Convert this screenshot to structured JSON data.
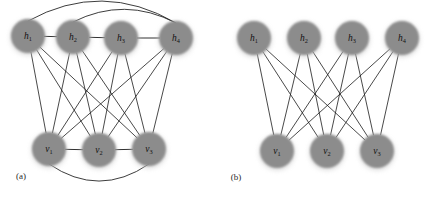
{
  "figure": {
    "background_color": "#ffffff",
    "node_fill_color": "#8c8c8c",
    "edge_color": "#1a1a1a",
    "label_color": "#111111",
    "node_radius": 17,
    "panels": [
      {
        "id": "a",
        "caption": "(a)",
        "caption_x": 21,
        "caption_y": 177,
        "hidden_layer": {
          "name": "hidden-units",
          "nodes": [
            {
              "id": "h1",
              "label": "h",
              "subscript": "1",
              "cx": 28,
              "cy": 36
            },
            {
              "id": "h2",
              "label": "h",
              "subscript": "2",
              "cx": 73,
              "cy": 37
            },
            {
              "id": "h3",
              "label": "h",
              "subscript": "3",
              "cx": 121,
              "cy": 38
            },
            {
              "id": "h4",
              "label": "h",
              "subscript": "4",
              "cx": 176,
              "cy": 38
            }
          ]
        },
        "visible_layer": {
          "name": "visible-units",
          "nodes": [
            {
              "id": "v1",
              "label": "v",
              "subscript": "1",
              "cx": 49,
              "cy": 149
            },
            {
              "id": "v2",
              "label": "v",
              "subscript": "2",
              "cx": 99,
              "cy": 150
            },
            {
              "id": "v3",
              "label": "v",
              "subscript": "3",
              "cx": 149,
              "cy": 149
            }
          ]
        },
        "bipartite_edges": [
          [
            "h1",
            "v1"
          ],
          [
            "h1",
            "v2"
          ],
          [
            "h1",
            "v3"
          ],
          [
            "h2",
            "v1"
          ],
          [
            "h2",
            "v2"
          ],
          [
            "h2",
            "v3"
          ],
          [
            "h3",
            "v1"
          ],
          [
            "h3",
            "v2"
          ],
          [
            "h3",
            "v3"
          ],
          [
            "h4",
            "v1"
          ],
          [
            "h4",
            "v2"
          ],
          [
            "h4",
            "v3"
          ]
        ],
        "lateral_edges": [
          [
            "h1",
            "h2"
          ],
          [
            "h2",
            "h3"
          ],
          [
            "h3",
            "h4"
          ],
          [
            "v1",
            "v2"
          ],
          [
            "v2",
            "v3"
          ]
        ],
        "arc_edges": [
          {
            "from": "h1",
            "to": "h4",
            "side": "top",
            "depth": 27
          },
          {
            "from": "h2",
            "to": "h4",
            "side": "top",
            "depth": 17
          },
          {
            "from": "v1",
            "to": "v3",
            "side": "bottom",
            "depth": 22
          }
        ]
      },
      {
        "id": "b",
        "caption": "(b)",
        "caption_x": 236,
        "caption_y": 178,
        "hidden_layer": {
          "name": "hidden-units",
          "nodes": [
            {
              "id": "h1",
              "label": "h",
              "subscript": "1",
              "cx": 254,
              "cy": 38
            },
            {
              "id": "h2",
              "label": "h",
              "subscript": "2",
              "cx": 304,
              "cy": 38
            },
            {
              "id": "h3",
              "label": "h",
              "subscript": "3",
              "cx": 352,
              "cy": 38
            },
            {
              "id": "h4",
              "label": "h",
              "subscript": "4",
              "cx": 402,
              "cy": 38
            }
          ]
        },
        "visible_layer": {
          "name": "visible-units",
          "nodes": [
            {
              "id": "v1",
              "label": "v",
              "subscript": "1",
              "cx": 277,
              "cy": 151
            },
            {
              "id": "v2",
              "label": "v",
              "subscript": "2",
              "cx": 327,
              "cy": 151
            },
            {
              "id": "v3",
              "label": "v",
              "subscript": "3",
              "cx": 377,
              "cy": 151
            }
          ]
        },
        "bipartite_edges": [
          [
            "h1",
            "v1"
          ],
          [
            "h1",
            "v2"
          ],
          [
            "h1",
            "v3"
          ],
          [
            "h2",
            "v1"
          ],
          [
            "h2",
            "v2"
          ],
          [
            "h2",
            "v3"
          ],
          [
            "h3",
            "v1"
          ],
          [
            "h3",
            "v2"
          ],
          [
            "h3",
            "v3"
          ],
          [
            "h4",
            "v1"
          ],
          [
            "h4",
            "v2"
          ],
          [
            "h4",
            "v3"
          ]
        ],
        "lateral_edges": [],
        "arc_edges": []
      }
    ]
  }
}
